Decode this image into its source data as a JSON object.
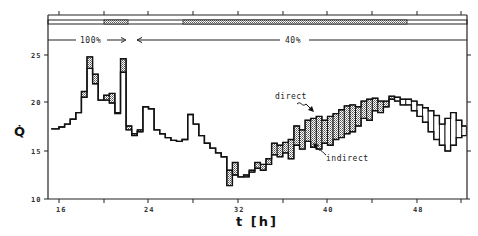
{
  "chart_data": {
    "type": "line",
    "title": "",
    "xlabel": "t [h]",
    "ylabel": "Q̇",
    "xlim": [
      15.3,
      52.4
    ],
    "ylim": [
      10,
      26.5
    ],
    "x_ticks": [
      16,
      24,
      32,
      40,
      48
    ],
    "x_tick_labels": [
      "16",
      "24",
      "32",
      "40",
      "48"
    ],
    "y_ticks": [
      10,
      15,
      20,
      25
    ],
    "y_tick_labels": [
      "10",
      "15",
      "20",
      "25"
    ],
    "grid": false,
    "legend": "annotations",
    "annotations": [
      {
        "text": "direct",
        "x": 38.5,
        "y": 19.5
      },
      {
        "text": "indirect",
        "x": 39.5,
        "y": 14.5
      }
    ],
    "top_band": {
      "labels": [
        {
          "text": "100%",
          "start": 15.3,
          "end": 22.5
        },
        {
          "text": "40%",
          "start": 22.5,
          "end": 52.4
        }
      ]
    },
    "series": [
      {
        "name": "direct",
        "x": [
          15.3,
          16,
          16.5,
          17,
          17.5,
          18,
          18.5,
          19,
          19.5,
          20,
          20.5,
          21,
          21.5,
          22,
          22.5,
          23,
          23.5,
          24,
          24.5,
          25,
          25.5,
          26,
          26.5,
          27,
          27.5,
          28,
          28.5,
          29,
          29.5,
          30,
          30.5,
          31,
          31.5,
          32,
          32.5,
          33,
          33.5,
          34,
          34.5,
          35,
          35.5,
          36,
          36.5,
          37,
          37.5,
          38,
          38.5,
          39,
          39.5,
          40,
          40.5,
          41,
          41.5,
          42,
          42.5,
          43,
          43.5,
          44,
          44.5,
          45,
          45.5,
          46,
          46.5,
          47,
          47.5,
          48,
          48.5,
          49,
          49.5,
          50,
          50.5,
          51,
          51.5,
          52
        ],
        "values": [
          17.3,
          17.5,
          17.8,
          18.3,
          19,
          21.2,
          24.8,
          23,
          20.3,
          20.8,
          21,
          19,
          24.6,
          17.6,
          16.8,
          17.2,
          19.6,
          19.4,
          17.2,
          16.8,
          16.4,
          16.1,
          16,
          16.2,
          18.8,
          17.8,
          16.6,
          15.8,
          15.3,
          14.8,
          14.4,
          13,
          12.5,
          12.3,
          12.5,
          13,
          13.8,
          13.6,
          14.2,
          15.8,
          15.6,
          15.9,
          16.2,
          17.6,
          17.2,
          18.2,
          18.4,
          18.6,
          18.2,
          18.6,
          18.9,
          19.3,
          19.7,
          19.8,
          19.6,
          20.2,
          20.4,
          20.5,
          20.2,
          20.2,
          20.7,
          20.6,
          20.4,
          20.4,
          20.2,
          19.8,
          19.5,
          19.2,
          18.7,
          17.8,
          18.4,
          19,
          18.2,
          17.6
        ]
      },
      {
        "name": "indirect",
        "x": [
          15.3,
          16,
          16.5,
          17,
          17.5,
          18,
          18.5,
          19,
          19.5,
          20,
          20.5,
          21,
          21.5,
          22,
          22.5,
          23,
          23.5,
          24,
          24.5,
          25,
          25.5,
          26,
          26.5,
          27,
          27.5,
          28,
          28.5,
          29,
          29.5,
          30,
          30.5,
          31,
          31.5,
          32,
          32.5,
          33,
          33.5,
          34,
          34.5,
          35,
          35.5,
          36,
          36.5,
          37,
          37.5,
          38,
          38.5,
          39,
          39.5,
          40,
          40.5,
          41,
          41.5,
          42,
          42.5,
          43,
          43.5,
          44,
          44.5,
          45,
          45.5,
          46,
          46.5,
          47,
          47.5,
          48,
          48.5,
          49,
          49.5,
          50,
          50.5,
          51,
          51.5,
          52
        ],
        "values": [
          17.3,
          17.5,
          17.8,
          18.3,
          19,
          20.6,
          23.6,
          22,
          20.3,
          20.3,
          20,
          18.9,
          23.2,
          17.2,
          16.6,
          17,
          19.6,
          19.4,
          17.2,
          16.8,
          16.4,
          16.1,
          16,
          16.2,
          18.8,
          17.8,
          16.6,
          15.8,
          15.3,
          14.8,
          14.4,
          11.4,
          13.8,
          12.3,
          12.3,
          12.8,
          13.2,
          13,
          13.6,
          14.6,
          14.4,
          14.8,
          14.2,
          15.6,
          15.2,
          16,
          15.4,
          15.2,
          15.8,
          15.6,
          16.2,
          16.4,
          16.8,
          17,
          17.6,
          18.4,
          18.2,
          19.2,
          19,
          19.6,
          20.4,
          20.2,
          19.8,
          19.8,
          19.2,
          18.6,
          18,
          17,
          16.2,
          15.6,
          15,
          15.6,
          16.4,
          16.6
        ]
      }
    ]
  },
  "labels": {
    "x_axis": "t [h]",
    "y_axis": "Q̇",
    "direct": "direct",
    "indirect": "indirect",
    "pct_100": "100%",
    "pct_40": "40%",
    "arrow_right": "→",
    "arrow_left": "←",
    "x16": "16",
    "x24": "24",
    "x32": "32",
    "x40": "40",
    "x48": "48",
    "y25": "25",
    "y20": "20",
    "y15": "15",
    "y10": "10"
  }
}
